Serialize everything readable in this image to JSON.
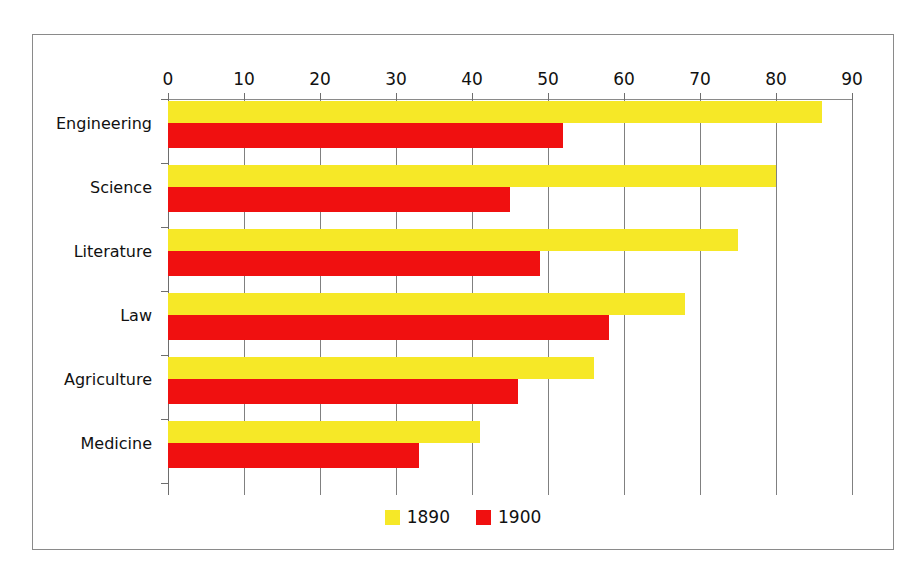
{
  "chart_data": {
    "type": "bar",
    "orientation": "horizontal",
    "title": "",
    "xlabel": "",
    "ylabel": "",
    "xlim": [
      0,
      90
    ],
    "xticks": [
      0,
      10,
      20,
      30,
      40,
      50,
      60,
      70,
      80,
      90
    ],
    "grid": true,
    "legend_position": "bottom-center",
    "categories": [
      "Engineering",
      "Science",
      "Literature",
      "Law",
      "Agriculture",
      "Medicine"
    ],
    "series": [
      {
        "name": "1890",
        "color": "#f6e827",
        "values": [
          86,
          80,
          75,
          68,
          56,
          41
        ]
      },
      {
        "name": "1900",
        "color": "#f01010",
        "values": [
          52,
          45,
          49,
          58,
          46,
          33
        ]
      }
    ]
  },
  "axis": {
    "tick_labels": [
      "0",
      "10",
      "20",
      "30",
      "40",
      "50",
      "60",
      "70",
      "80",
      "90"
    ]
  },
  "legend": {
    "entries": [
      {
        "label": "1890",
        "color": "#f6e827"
      },
      {
        "label": "1900",
        "color": "#f01010"
      }
    ]
  },
  "colors": {
    "series_1890": "#f6e827",
    "series_1900": "#f01010",
    "gridline": "#808080",
    "frame_border": "#8a8a8a",
    "background": "#ffffff",
    "text": "#111111"
  }
}
